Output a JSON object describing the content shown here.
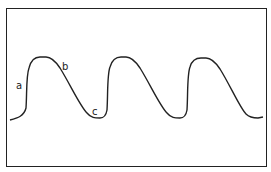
{
  "diagram": {
    "type": "waveform",
    "cycles": 3,
    "labels": {
      "a": "a",
      "b": "b",
      "c": "c"
    },
    "line_color": "#222222",
    "border_color": "#222222"
  }
}
